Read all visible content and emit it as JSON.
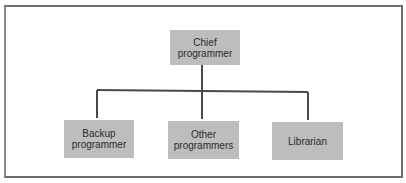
{
  "colors": {
    "frame": "#6e6e6e",
    "box_fill": "#bdbdbd",
    "connector": "#4a4a4a",
    "text": "#2a2a2a"
  },
  "root": {
    "label_line1": "Chief",
    "label_line2": "programmer"
  },
  "children": [
    {
      "label_line1": "Backup",
      "label_line2": "programmer"
    },
    {
      "label_line1": "Other",
      "label_line2": "programmers"
    },
    {
      "label_line1": "Librarian",
      "label_line2": ""
    }
  ]
}
